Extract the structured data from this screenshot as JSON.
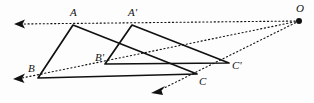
{
  "figure": {
    "type": "geometry-diagram",
    "background_color": "#fdfdfd",
    "stroke_color": "#111111",
    "center_point": {
      "label": "O",
      "x": 299,
      "y": 21
    },
    "labels": [
      {
        "name": "label-A",
        "text": "A",
        "x": 70,
        "y": 7
      },
      {
        "name": "label-A-prime",
        "text": "A'",
        "x": 128,
        "y": 7
      },
      {
        "name": "label-B",
        "text": "B",
        "x": 28,
        "y": 63
      },
      {
        "name": "label-B-prime",
        "text": "B'",
        "x": 95,
        "y": 52
      },
      {
        "name": "label-C",
        "text": "C",
        "x": 199,
        "y": 76
      },
      {
        "name": "label-C-prime",
        "text": "C'",
        "x": 232,
        "y": 60
      },
      {
        "name": "label-O",
        "text": "O",
        "x": 296,
        "y": 3
      }
    ],
    "vertices": [
      {
        "name": "A",
        "x": 73,
        "y": 25
      },
      {
        "name": "B",
        "x": 38,
        "y": 78
      },
      {
        "name": "C",
        "x": 197,
        "y": 74
      },
      {
        "name": "A2",
        "x": 132,
        "y": 25
      },
      {
        "name": "B2",
        "x": 105,
        "y": 64
      },
      {
        "name": "C2",
        "x": 229,
        "y": 63
      }
    ],
    "solid_triangles": [
      {
        "name": "triangle-ABC",
        "points": "73,25 38,78 197,74"
      },
      {
        "name": "triangle-A-prime-B-prime-C-prime",
        "points": "132,25 105,64 229,63"
      }
    ],
    "ray_lines": [
      {
        "name": "ray-O-through-A",
        "x1": 299,
        "y1": 21,
        "x2": 20,
        "y2": 24
      },
      {
        "name": "ray-O-through-B",
        "x1": 299,
        "y1": 21,
        "x2": 22,
        "y2": 78
      },
      {
        "name": "ray-O-through-C",
        "x1": 299,
        "y1": 21,
        "x2": 156,
        "y2": 92
      }
    ],
    "arrowheads": [
      {
        "name": "arrowhead-ray-A",
        "x": 15,
        "y": 24,
        "angle": 180
      },
      {
        "name": "arrowhead-ray-B",
        "x": 15,
        "y": 78,
        "angle": 188
      },
      {
        "name": "arrowhead-ray-C",
        "x": 153,
        "y": 92,
        "angle": 207
      }
    ]
  }
}
